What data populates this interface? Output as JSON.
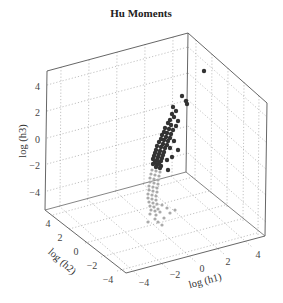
{
  "chart_data": {
    "type": "scatter",
    "subtype": "scatter3d",
    "title": "Hu Moments",
    "xlabel": "log (h1)",
    "ylabel": "log (h2)",
    "zlabel": "log (h3)",
    "xlim": [
      -5,
      5
    ],
    "ylim": [
      -5,
      5
    ],
    "zlim": [
      -5,
      5
    ],
    "xticks": [
      -4,
      -2,
      0,
      2,
      4
    ],
    "yticks": [
      4,
      2,
      0,
      -2,
      -4
    ],
    "zticks": [
      4,
      2,
      0,
      -2,
      -4
    ],
    "grid": true,
    "legend": null,
    "series": [
      {
        "name": "class A (dark)",
        "color": "#333333",
        "marker_size": 2.2,
        "description": "dense elongated cluster of dark points rising from about log(h3)=-1 to 2.5, log(h1) ~ -1 to 1, log(h2) ~ 0; one outlier near the top-right",
        "points_screen": [
          [
            204,
            71
          ],
          [
            182,
            96
          ],
          [
            186,
            101
          ],
          [
            187,
            104
          ],
          [
            173,
            107
          ],
          [
            176,
            111
          ],
          [
            172,
            114
          ],
          [
            174,
            117
          ],
          [
            170,
            120
          ],
          [
            178,
            121
          ],
          [
            168,
            123
          ],
          [
            171,
            125
          ],
          [
            176,
            126
          ],
          [
            165,
            128
          ],
          [
            169,
            129
          ],
          [
            173,
            130
          ],
          [
            164,
            132
          ],
          [
            167,
            133
          ],
          [
            171,
            134
          ],
          [
            162,
            135
          ],
          [
            166,
            137
          ],
          [
            170,
            138
          ],
          [
            161,
            139
          ],
          [
            164,
            140
          ],
          [
            168,
            141
          ],
          [
            174,
            141
          ],
          [
            159,
            142
          ],
          [
            163,
            144
          ],
          [
            167,
            145
          ],
          [
            157,
            146
          ],
          [
            161,
            147
          ],
          [
            165,
            148
          ],
          [
            170,
            148
          ],
          [
            156,
            150
          ],
          [
            160,
            151
          ],
          [
            164,
            152
          ],
          [
            178,
            150
          ],
          [
            155,
            153
          ],
          [
            159,
            154
          ],
          [
            163,
            155
          ],
          [
            154,
            156
          ],
          [
            158,
            157
          ],
          [
            162,
            158
          ],
          [
            172,
            157
          ],
          [
            153,
            159
          ],
          [
            157,
            160
          ],
          [
            161,
            161
          ],
          [
            155,
            162
          ],
          [
            159,
            163
          ],
          [
            167,
            160
          ],
          [
            153,
            164
          ],
          [
            157,
            165
          ],
          [
            161,
            166
          ],
          [
            156,
            167
          ],
          [
            160,
            168
          ],
          [
            168,
            170
          ]
        ]
      },
      {
        "name": "class B (light)",
        "color": "#aaaaaa",
        "marker_size": 1.6,
        "description": "lighter grey points in a column below the dark cluster, log(h3) ~ -1 to -4, with a few scattered points lower",
        "points_screen": [
          [
            152,
            170
          ],
          [
            156,
            171
          ],
          [
            160,
            172
          ],
          [
            151,
            174
          ],
          [
            155,
            175
          ],
          [
            159,
            176
          ],
          [
            150,
            178
          ],
          [
            154,
            179
          ],
          [
            158,
            180
          ],
          [
            150,
            182
          ],
          [
            154,
            183
          ],
          [
            158,
            184
          ],
          [
            149,
            186
          ],
          [
            153,
            187
          ],
          [
            157,
            188
          ],
          [
            149,
            190
          ],
          [
            153,
            191
          ],
          [
            157,
            192
          ],
          [
            148,
            194
          ],
          [
            152,
            195
          ],
          [
            156,
            196
          ],
          [
            148,
            198
          ],
          [
            152,
            199
          ],
          [
            156,
            200
          ],
          [
            149,
            202
          ],
          [
            153,
            203
          ],
          [
            157,
            204
          ],
          [
            150,
            206
          ],
          [
            154,
            207
          ],
          [
            151,
            210
          ],
          [
            155,
            211
          ],
          [
            158,
            209
          ],
          [
            162,
            205
          ],
          [
            167,
            208
          ],
          [
            150,
            214
          ],
          [
            156,
            215
          ],
          [
            160,
            212
          ],
          [
            155,
            219
          ],
          [
            164,
            218
          ],
          [
            170,
            213
          ],
          [
            158,
            222
          ],
          [
            162,
            225
          ],
          [
            175,
            210
          ],
          [
            148,
            222
          ]
        ]
      }
    ]
  }
}
